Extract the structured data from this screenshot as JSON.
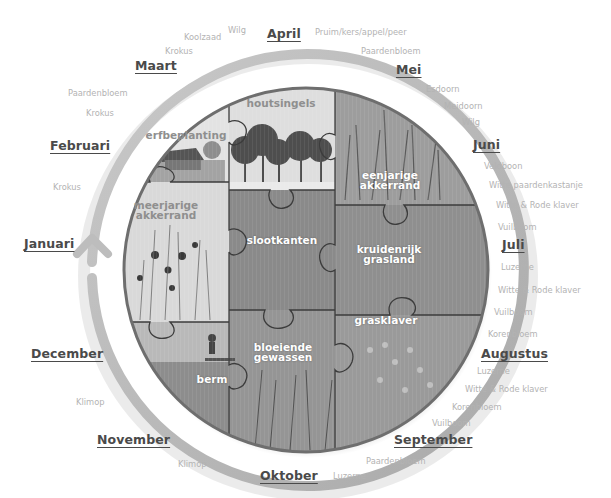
{
  "diagram": {
    "type": "seasonal-puzzle-wheel",
    "colors": {
      "ring": "#bdbdbd",
      "month_text": "#4a4a4a",
      "plant_text": "#b3b3b3",
      "piece_border": "#3c3c3c",
      "circle_border": "#6e6e6e"
    },
    "months": [
      {
        "label": "Januari",
        "x": 24,
        "y": 244
      },
      {
        "label": "Februari",
        "x": 50,
        "y": 146
      },
      {
        "label": "Maart",
        "x": 136,
        "y": 58
      },
      {
        "label": "April",
        "x": 267,
        "y": 27
      },
      {
        "label": "Mei",
        "x": 396,
        "y": 63
      },
      {
        "label": "Juni",
        "x": 473,
        "y": 138
      },
      {
        "label": "Juli",
        "x": 501,
        "y": 244
      },
      {
        "label": "Augustus",
        "x": 480,
        "y": 352
      },
      {
        "label": "September",
        "x": 394,
        "y": 432
      },
      {
        "label": "Oktober",
        "x": 259,
        "y": 469
      },
      {
        "label": "November",
        "x": 96,
        "y": 432
      },
      {
        "label": "December",
        "x": 31,
        "y": 346
      }
    ],
    "plants": [
      {
        "month": "Februari",
        "label": "Krokus",
        "x": 53,
        "y": 182
      },
      {
        "month": "Maart",
        "label": "Paardenbloem",
        "x": 68,
        "y": 89
      },
      {
        "month": "Maart",
        "label": "Krokus",
        "x": 86,
        "y": 108
      },
      {
        "month": "April",
        "label": "Krokus",
        "x": 165,
        "y": 47
      },
      {
        "month": "April",
        "label": "Koolzaad",
        "x": 184,
        "y": 33
      },
      {
        "month": "April",
        "label": "Wilg",
        "x": 228,
        "y": 26
      },
      {
        "month": "Mei",
        "label": "Pruim/kers/appel/peer",
        "x": 315,
        "y": 28
      },
      {
        "month": "Mei",
        "label": "Paardenbloem",
        "x": 361,
        "y": 47
      },
      {
        "month": "Juni",
        "label": "Esdoorn",
        "x": 426,
        "y": 84
      },
      {
        "month": "Juni",
        "label": "Meidoorn",
        "x": 444,
        "y": 101
      },
      {
        "month": "Juni",
        "label": "Wilg",
        "x": 462,
        "y": 117
      },
      {
        "month": "Juli",
        "label": "Veldboon",
        "x": 484,
        "y": 162
      },
      {
        "month": "Juli",
        "label": "Witte paardenkastanje",
        "x": 489,
        "y": 181
      },
      {
        "month": "Juli",
        "label": "Witte & Rode klaver",
        "x": 496,
        "y": 201
      },
      {
        "month": "Juli",
        "label": "Vuilboom",
        "x": 498,
        "y": 223
      },
      {
        "month": "Augustus",
        "label": "Luzerne",
        "x": 501,
        "y": 263
      },
      {
        "month": "Augustus",
        "label": "Witte & Rode klaver",
        "x": 498,
        "y": 286
      },
      {
        "month": "Augustus",
        "label": "Vuilboom",
        "x": 494,
        "y": 308
      },
      {
        "month": "Augustus",
        "label": "Korenbloem",
        "x": 488,
        "y": 330
      },
      {
        "month": "September",
        "label": "Luzerne",
        "x": 477,
        "y": 367
      },
      {
        "month": "September",
        "label": "Witte & Rode klaver",
        "x": 465,
        "y": 385
      },
      {
        "month": "September",
        "label": "Korenbloem",
        "x": 452,
        "y": 403
      },
      {
        "month": "September",
        "label": "Vuilboom",
        "x": 432,
        "y": 419
      },
      {
        "month": "Oktober",
        "label": "Paardenbloem",
        "x": 366,
        "y": 457
      },
      {
        "month": "Oktober",
        "label": "Luzerne",
        "x": 333,
        "y": 471
      },
      {
        "month": "November",
        "label": "Klimop",
        "x": 178,
        "y": 460
      },
      {
        "month": "December",
        "label": "Klimop",
        "x": 76,
        "y": 398
      }
    ],
    "pieces": [
      {
        "id": "erfbeplanting",
        "label": "erfbeplanting",
        "tone": "dark",
        "x": 186,
        "y": 138
      },
      {
        "id": "houtsingels",
        "label": "houtsingels",
        "tone": "dark",
        "x": 281,
        "y": 106
      },
      {
        "id": "eenjarige",
        "label": "eenjarige\nakkerrand",
        "tone": "light",
        "x": 390,
        "y": 177
      },
      {
        "id": "meerjarige",
        "label": "meerjarige\nakkerrand",
        "tone": "dark",
        "x": 166,
        "y": 208
      },
      {
        "id": "slootkanten",
        "label": "slootkanten",
        "tone": "light",
        "x": 282,
        "y": 237
      },
      {
        "id": "kruidenrijk",
        "label": "kruidenrijk\ngrasland",
        "tone": "light",
        "x": 388,
        "y": 252
      },
      {
        "id": "grasklaver",
        "label": "grasklaver",
        "tone": "light",
        "x": 387,
        "y": 320
      },
      {
        "id": "bloeiende",
        "label": "bloeiende\ngewassen",
        "tone": "light",
        "x": 289,
        "y": 350
      },
      {
        "id": "berm",
        "label": "berm",
        "tone": "light",
        "x": 211,
        "y": 374
      }
    ]
  }
}
